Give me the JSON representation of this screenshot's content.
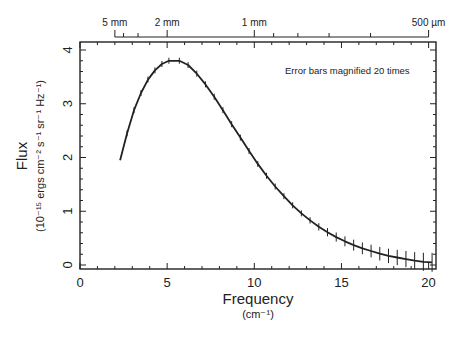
{
  "chart_data": {
    "type": "line",
    "title": "",
    "xlabel": "Frequency",
    "xlabel_unit": "(cm⁻¹)",
    "ylabel": "Flux",
    "ylabel_unit": "(10⁻¹⁵ ergs cm⁻² s⁻¹ sr⁻¹ Hz⁻¹)",
    "xlim": [
      0,
      20.4
    ],
    "ylim": [
      -0.1,
      4.2
    ],
    "x_ticks": [
      0,
      5,
      10,
      15,
      20
    ],
    "y_ticks": [
      0,
      1,
      2,
      3,
      4
    ],
    "grid": false,
    "annotation": "Error bars magnified 20 times",
    "top_axis": {
      "label_ticks": [
        {
          "label": "5 mm",
          "freq": 2.0
        },
        {
          "label": "2 mm",
          "freq": 5.0
        },
        {
          "label": "1 mm",
          "freq": 10.0
        },
        {
          "label": "500 µm",
          "freq": 20.0
        }
      ],
      "minor_ticks_freq": [
        2.5,
        3.33,
        11.11,
        12.5,
        14.29,
        16.67
      ]
    },
    "series": [
      {
        "name": "Flux",
        "x": [
          2.3,
          2.7,
          3.1,
          3.5,
          3.9,
          4.3,
          4.7,
          5.1,
          5.7,
          6.2,
          6.7,
          7.2,
          7.7,
          8.2,
          8.7,
          9.2,
          9.7,
          10.2,
          10.7,
          11.2,
          11.7,
          12.2,
          12.7,
          13.2,
          13.7,
          14.2,
          14.7,
          15.2,
          15.7,
          16.2,
          16.7,
          17.2,
          17.7,
          18.2,
          18.7,
          19.2,
          19.7,
          20.2
        ],
        "y": [
          1.95,
          2.45,
          2.88,
          3.2,
          3.45,
          3.62,
          3.74,
          3.8,
          3.8,
          3.72,
          3.56,
          3.36,
          3.13,
          2.88,
          2.62,
          2.37,
          2.12,
          1.88,
          1.66,
          1.46,
          1.28,
          1.11,
          0.96,
          0.83,
          0.71,
          0.61,
          0.52,
          0.44,
          0.37,
          0.31,
          0.26,
          0.21,
          0.17,
          0.14,
          0.11,
          0.08,
          0.06,
          0.05
        ],
        "error_bars_visible": true
      }
    ]
  }
}
